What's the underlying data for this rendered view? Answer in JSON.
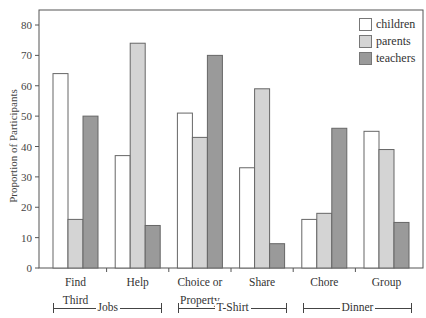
{
  "chart_data": {
    "type": "bar",
    "title": "",
    "xlabel": "",
    "ylabel": "Proportion of Participants",
    "ylim": [
      0,
      80
    ],
    "yticks": [
      0,
      10,
      20,
      30,
      40,
      50,
      60,
      70,
      80
    ],
    "grid": false,
    "legend_position": "top-right",
    "categories": [
      "Find Third",
      "Help",
      "Choice or Property",
      "Share",
      "Chore",
      "Group"
    ],
    "category_lines": [
      [
        "Find",
        "Third"
      ],
      [
        "Help"
      ],
      [
        "Choice or",
        "Property"
      ],
      [
        "Share"
      ],
      [
        "Chore"
      ],
      [
        "Group"
      ]
    ],
    "series": [
      {
        "name": "children",
        "color": "#ffffff",
        "values": [
          64,
          37,
          51,
          33,
          16,
          45
        ]
      },
      {
        "name": "parents",
        "color": "#d4d4d4",
        "values": [
          16,
          74,
          43,
          59,
          18,
          39
        ]
      },
      {
        "name": "teachers",
        "color": "#9a9a9a",
        "values": [
          50,
          14,
          70,
          8,
          46,
          15
        ]
      }
    ],
    "groups": [
      {
        "label": "Jobs",
        "categories": [
          "Find Third",
          "Help"
        ]
      },
      {
        "label": "T-Shirt",
        "categories": [
          "Choice or Property",
          "Share"
        ]
      },
      {
        "label": "Dinner",
        "categories": [
          "Chore",
          "Group"
        ]
      }
    ]
  },
  "legend": {
    "items": [
      {
        "label": "children",
        "color": "#ffffff"
      },
      {
        "label": "parents",
        "color": "#d4d4d4"
      },
      {
        "label": "teachers",
        "color": "#9a9a9a"
      }
    ]
  },
  "axis": {
    "ylabel": "Proportion of Participants"
  }
}
